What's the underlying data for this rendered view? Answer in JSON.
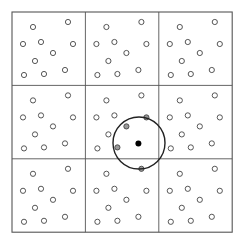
{
  "diagram": {
    "type": "periodic-cell-neighbor-search",
    "grid": {
      "rows": 3,
      "cols": 3,
      "origin": [
        12,
        12
      ],
      "cell_size": 73.4,
      "line_color": "#555555"
    },
    "cell_pattern": [
      [
        21,
        15
      ],
      [
        56,
        10
      ],
      [
        11,
        32
      ],
      [
        29,
        30
      ],
      [
        61,
        32
      ],
      [
        41,
        41
      ],
      [
        23,
        49
      ],
      [
        12,
        63
      ],
      [
        32,
        62
      ],
      [
        53,
        58
      ]
    ],
    "point_style": {
      "radius": 2.6,
      "stroke": "#444444",
      "open_fill": "#ffffff",
      "neighbor_fill": "#9a9a9a"
    },
    "cutoff_circle": {
      "center": [
        139,
        143
      ],
      "radius": 26,
      "stroke": "#222222"
    },
    "center_particle": {
      "cell": [
        1,
        1
      ],
      "pattern_index": 9,
      "fill": "#000000",
      "radius": 3
    },
    "neighbors": [
      {
        "cell": [
          1,
          1
        ],
        "pattern_index": 4
      },
      {
        "cell": [
          1,
          1
        ],
        "pattern_index": 5
      },
      {
        "cell": [
          1,
          1
        ],
        "pattern_index": 8
      },
      {
        "cell": [
          2,
          1
        ],
        "pattern_index": 1
      }
    ]
  }
}
